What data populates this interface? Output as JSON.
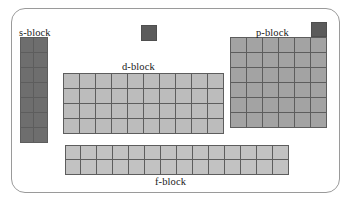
{
  "diagram": {
    "frame": {
      "border_color": "#9a9a9a"
    },
    "labels": {
      "s": "s-block",
      "d": "d-block",
      "p": "p-block",
      "f": "f-block"
    },
    "colors": {
      "s_block_fill": "#6e6e6e",
      "d_block_fill": "#bcbcbc",
      "p_block_fill": "#a3a3a3",
      "f_block_fill": "#c2c2c2",
      "highlight_fill": "#5b5b5b",
      "cell_border": "#5d5d5d",
      "background": "#ffffff",
      "text": "#1a1a1a"
    },
    "blocks": [
      {
        "id": "s-block",
        "label": "s-block",
        "columns": 2,
        "rows": 7,
        "cells": 14,
        "fill": "#6e6e6e",
        "shade": "dark-gray"
      },
      {
        "id": "d-block",
        "label": "d-block",
        "columns": 10,
        "rows": 4,
        "cells": 40,
        "fill": "#bcbcbc",
        "shade": "light-gray"
      },
      {
        "id": "p-block",
        "label": "p-block",
        "columns": 6,
        "rows": 6,
        "cells": 36,
        "fill": "#a3a3a3",
        "shade": "medium-gray"
      },
      {
        "id": "f-block",
        "label": "f-block",
        "columns": 14,
        "rows": 2,
        "cells": 28,
        "fill": "#c2c2c2",
        "shade": "light-gray"
      }
    ],
    "standalone_cells": [
      {
        "id": "hydrogen-cell",
        "position": "top-center",
        "fill": "#5b5b5b",
        "shade": "dark-gray"
      },
      {
        "id": "helium-cell",
        "position": "top-right-above-p-block",
        "fill": "#5b5b5b",
        "shade": "dark-gray"
      }
    ]
  },
  "chart_data": {
    "type": "table",
    "categories": [
      "s-block",
      "d-block",
      "p-block",
      "f-block"
    ],
    "series": [
      {
        "name": "columns",
        "values": [
          2,
          10,
          6,
          14
        ]
      },
      {
        "name": "rows",
        "values": [
          7,
          4,
          6,
          2
        ]
      },
      {
        "name": "cells",
        "values": [
          14,
          40,
          36,
          28
        ]
      }
    ],
    "annotations": [
      "isolated dark cell at top center",
      "isolated dark cell above right edge of p-block"
    ],
    "xlabel": "",
    "ylabel": "",
    "grid": true,
    "legend": "none"
  }
}
